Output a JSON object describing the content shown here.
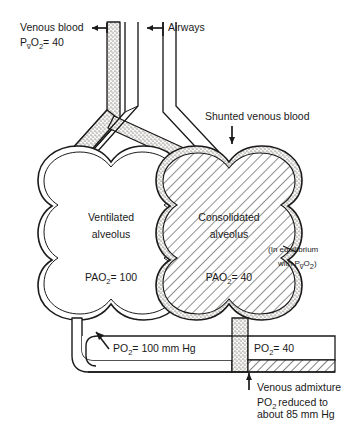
{
  "figure": {
    "type": "physiology-diagram",
    "colors": {
      "ink": "#1a1a1a",
      "stipple": "#b9b4ae",
      "hatch": "#4a4a4a",
      "paper": "#ffffff"
    }
  },
  "labels": {
    "venous_blood": "Venous blood",
    "venous_blood_value_p": "P",
    "venous_blood_value_vbar": "v̅",
    "venous_blood_value_o": "O",
    "venous_blood_value_sub": "2",
    "venous_blood_value_eq": "= 40",
    "airways": "Airways",
    "shunted_venous_blood": "Shunted venous blood",
    "ventilated_line1": "Ventilated",
    "ventilated_line2": "alveolus",
    "consolidated_line1": "Consolidated",
    "consolidated_line2": "alveolus",
    "pao2_left_prefix": "PAO",
    "pao2_left_sub": "2",
    "pao2_left_value": "= 100",
    "pao2_right_prefix": "PAO",
    "pao2_right_sub": "2",
    "pao2_right_value": "= 40",
    "equilibrium_line1": "(In equilibrium",
    "equilibrium_line2_a": "with P",
    "equilibrium_line2_vbar": "v̅",
    "equilibrium_line2_b": "O",
    "equilibrium_line2_sub": "2",
    "equilibrium_line2_c": ")",
    "po2_left_prefix": "PO",
    "po2_left_sub": "2",
    "po2_left_value": "= 100 mm Hg",
    "po2_right_prefix": "PO",
    "po2_right_sub": "2",
    "po2_right_value": "= 40",
    "venous_admixture": "Venous admixture",
    "admixture_line1_prefix": "PO",
    "admixture_line1_sub": "2",
    "admixture_line1_rest": "reduced to",
    "admixture_line2": "about 85 mm Hg"
  },
  "values": {
    "pv_o2_mixed_venous": 40,
    "pao2_ventilated_alveolus": 100,
    "pao2_consolidated_alveolus": 40,
    "po2_end_capillary_ventilated": 100,
    "po2_shunt_blood": 40,
    "po2_arterial_after_admixture": 85,
    "units": "mm Hg"
  },
  "icons": {
    "pointer_left_arrow": "arrow-left-icon",
    "pointer_down_arrow": "arrow-down-icon",
    "pointer_up_arrow": "arrow-up-icon",
    "leader_arrow": "leader-arrow-icon"
  }
}
